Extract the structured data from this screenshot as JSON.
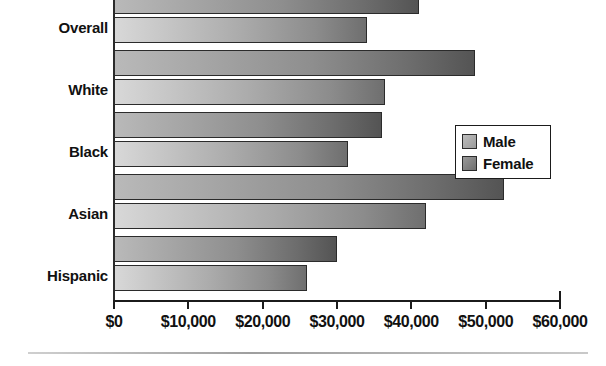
{
  "chart_data": {
    "type": "bar",
    "orientation": "horizontal",
    "title": "",
    "xlabel": "",
    "ylabel": "",
    "xlim": [
      0,
      60000
    ],
    "xtick_values": [
      0,
      10000,
      20000,
      30000,
      40000,
      50000,
      60000
    ],
    "xtick_labels": [
      "$0",
      "$10,000",
      "$20,000",
      "$30,000",
      "$40,000",
      "$50,000",
      "$60,000"
    ],
    "categories": [
      "Overall",
      "White",
      "Black",
      "Asian",
      "Hispanic"
    ],
    "grid": false,
    "legend_position": "right-middle",
    "series": [
      {
        "name": "Male",
        "color": "#9a9a9a",
        "values": [
          41000,
          48500,
          36000,
          52500,
          30000
        ]
      },
      {
        "name": "Female",
        "color": "#787878",
        "values": [
          34000,
          36500,
          31500,
          42000,
          26000
        ]
      }
    ]
  },
  "legend": {
    "items": [
      {
        "label": "Male",
        "swatch": "swatch-male"
      },
      {
        "label": "Female",
        "swatch": "swatch-female"
      }
    ]
  }
}
